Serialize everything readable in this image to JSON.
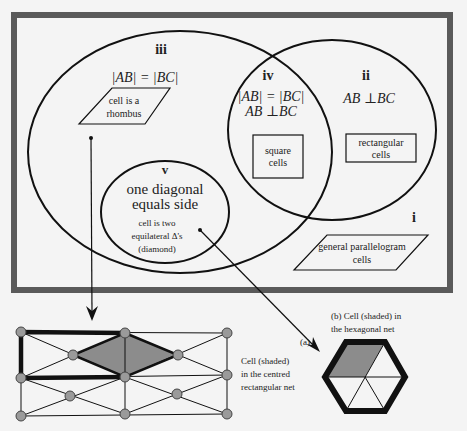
{
  "colors": {
    "frame": "#5a5a5a",
    "background": "#f4f4f4",
    "line": "#111111",
    "node_fill": "#9a9a9a",
    "shade": "#8c8c8c"
  },
  "venn": {
    "region_iii": {
      "label": "iii",
      "condition": "|AB| = |BC|",
      "shape_text": [
        "cell is a",
        "rhombus"
      ]
    },
    "region_iv": {
      "label": "iv",
      "condition_1": "|AB| = |BC|",
      "condition_2": "AB ⊥BC",
      "shape_text": [
        "square",
        "cells"
      ]
    },
    "region_ii": {
      "label": "ii",
      "condition": "AB ⊥BC",
      "shape_text": [
        "rectangular",
        "cells"
      ]
    },
    "region_v": {
      "label": "v",
      "heading": [
        "one diagonal",
        "equals side"
      ],
      "shape_text": [
        "cell is two",
        "equilateral  Δ's",
        "(diamond)"
      ]
    },
    "region_i": {
      "label": "i",
      "shape_text": [
        "general parallelogram",
        "cells"
      ]
    }
  },
  "figures": {
    "a": {
      "tag": "(a)",
      "caption": [
        "Cell (shaded)",
        "in the centred",
        "rectangular net"
      ]
    },
    "b": {
      "caption": [
        "(b) Cell (shaded) in",
        "the hexagonal net"
      ]
    }
  }
}
